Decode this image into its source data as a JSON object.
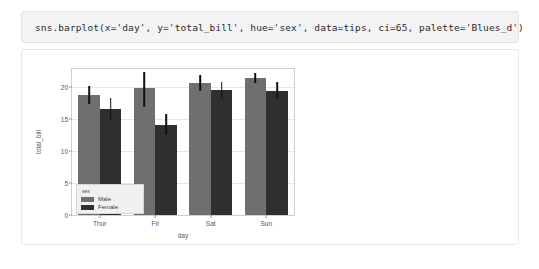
{
  "cell": {
    "code": "sns.barplot(x='day', y='total_bill', hue='sex', data=tips, ci=65, palette='Blues_d')"
  },
  "colors": {
    "male_bar": "#6f6f6f",
    "female_bar": "#2f2f2f",
    "errorbar": "#111111",
    "axes_frame": "#cfcfcf",
    "gridline": "#e6e6e6",
    "code_cell_bg": "#f3f3f3",
    "legend_bg": "#f0f0f0"
  },
  "chart_data": {
    "type": "bar",
    "title": "",
    "xlabel": "day",
    "ylabel": "total_bill",
    "categories": [
      "Thur",
      "Fri",
      "Sat",
      "Sun"
    ],
    "series": [
      {
        "name": "Male",
        "color": "#6f6f6f",
        "values": [
          18.8,
          19.8,
          20.6,
          21.4
        ],
        "err_low": [
          17.3,
          16.8,
          19.4,
          20.6
        ],
        "err_high": [
          20.1,
          22.4,
          21.8,
          22.2
        ]
      },
      {
        "name": "Female",
        "color": "#2f2f2f",
        "values": [
          16.6,
          14.1,
          19.6,
          19.4
        ],
        "err_low": [
          14.9,
          12.5,
          18.3,
          18.1
        ],
        "err_high": [
          18.2,
          15.8,
          20.8,
          20.7
        ]
      }
    ],
    "ylim": [
      0,
      22.8
    ],
    "yticks": [
      0,
      5,
      10,
      15,
      20
    ],
    "ytick_labels": [
      "0",
      "5",
      "10",
      "15",
      "20"
    ],
    "grid": true,
    "legend": {
      "title": "sex",
      "position": "lower-left",
      "entries": [
        "Male",
        "Female"
      ]
    }
  }
}
